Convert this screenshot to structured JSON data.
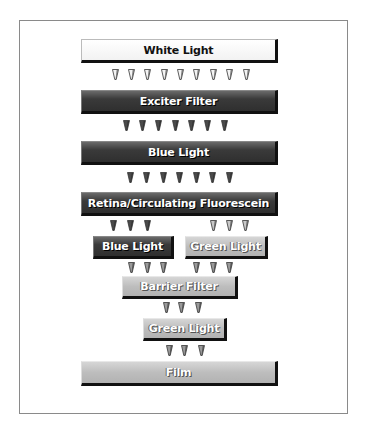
{
  "diagram": {
    "title": "",
    "nodes": [
      {
        "id": "white-light",
        "label": "White Light",
        "style": "white",
        "x": 81,
        "y": 39,
        "w": 197,
        "h": 24
      },
      {
        "id": "exciter-filter",
        "label": "Exciter Filter",
        "style": "dark",
        "x": 81,
        "y": 90,
        "w": 197,
        "h": 24
      },
      {
        "id": "blue-light-1",
        "label": "Blue Light",
        "style": "dark",
        "x": 81,
        "y": 141,
        "w": 197,
        "h": 24
      },
      {
        "id": "retina",
        "label": "Retina/Circulating Fluorescein",
        "style": "dark",
        "x": 81,
        "y": 192,
        "w": 197,
        "h": 24
      },
      {
        "id": "blue-light-2",
        "label": "Blue Light",
        "style": "dark",
        "x": 93,
        "y": 236,
        "w": 81,
        "h": 23
      },
      {
        "id": "green-light-1",
        "label": "Green Light",
        "style": "light",
        "x": 185,
        "y": 236,
        "w": 83,
        "h": 23
      },
      {
        "id": "barrier-filter",
        "label": "Barrier Filter",
        "style": "light",
        "x": 122,
        "y": 276,
        "w": 116,
        "h": 23
      },
      {
        "id": "green-light-2",
        "label": "Green Light",
        "style": "light",
        "x": 143,
        "y": 318,
        "w": 84,
        "h": 23
      },
      {
        "id": "film",
        "label": "Film",
        "style": "light",
        "x": 81,
        "y": 361,
        "w": 197,
        "h": 25
      }
    ],
    "arrow_rows": [
      {
        "from": "white-light",
        "to": "exciter-filter",
        "color": "white",
        "y": 69,
        "xs": [
          112,
          128,
          144,
          161,
          177,
          193,
          210,
          226,
          243
        ]
      },
      {
        "from": "exciter-filter",
        "to": "blue-light-1",
        "color": "dark",
        "y": 120,
        "xs": [
          123,
          139,
          155,
          172,
          188,
          204,
          221
        ]
      },
      {
        "from": "blue-light-1",
        "to": "retina",
        "color": "dark",
        "y": 172,
        "xs": [
          127,
          143,
          160,
          176,
          193,
          209,
          226
        ]
      },
      {
        "from": "retina",
        "to": "blue-light-2",
        "color": "dark",
        "y": 220,
        "xs": [
          110,
          127,
          144
        ]
      },
      {
        "from": "retina",
        "to": "green-light-1",
        "color": "light",
        "y": 220,
        "xs": [
          210,
          226,
          242
        ]
      },
      {
        "from": "blue-light-2 / green-light-1",
        "to": "barrier-filter",
        "color": "mid",
        "y": 262,
        "xs": [
          128,
          144,
          160,
          193,
          210,
          226
        ]
      },
      {
        "from": "barrier-filter",
        "to": "green-light-2",
        "color": "mid",
        "y": 302,
        "xs": [
          163,
          178,
          195
        ]
      },
      {
        "from": "green-light-2",
        "to": "film",
        "color": "mid",
        "y": 345,
        "xs": [
          166,
          181,
          198
        ]
      }
    ]
  },
  "colors": {
    "white": "#ffffff",
    "dark": "#333333",
    "light": "#bdbdbd",
    "shadow": "#111111",
    "arrow_white": "#f4f4f4",
    "arrow_dark": "#4a4a4a",
    "arrow_mid": "#9a9a9a",
    "arrow_light": "#c8c8c8"
  }
}
